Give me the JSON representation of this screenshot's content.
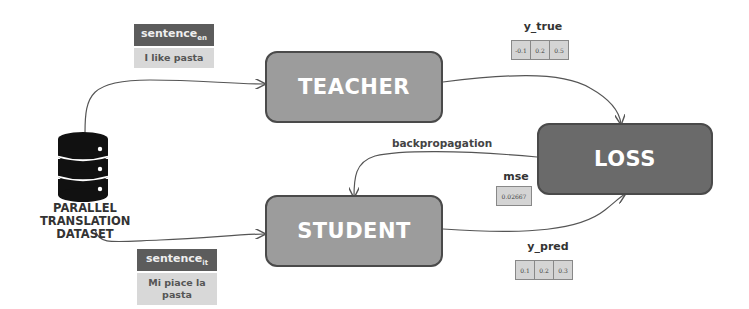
{
  "diagram": {
    "dataset": {
      "label_lines": [
        "PARALLEL",
        "TRANSLATION",
        "DATASET"
      ],
      "icon": "database-icon"
    },
    "nodes": {
      "teacher": {
        "label": "TEACHER"
      },
      "student": {
        "label": "STUDENT"
      },
      "loss": {
        "label": "LOSS"
      }
    },
    "inputs": {
      "en": {
        "head": "sentence",
        "sub": "en",
        "text": "I like pasta"
      },
      "it": {
        "head": "sentence",
        "sub": "it",
        "text": "Mi piace la pasta"
      }
    },
    "y_true": {
      "label": "y_true",
      "values": [
        "-0.1",
        "0.2",
        "0.5"
      ]
    },
    "y_pred": {
      "label": "y_pred",
      "values": [
        "0.1",
        "0.2",
        "0.3"
      ]
    },
    "mse": {
      "label": "mse",
      "value": "0.02667"
    },
    "edges": {
      "backprop_label": "backpropagation"
    },
    "colors": {
      "node_light": "#9c9c9c",
      "node_dark": "#6a6a6a",
      "tag_head": "#5c5c5c",
      "tag_body": "#d8d8d8"
    }
  }
}
